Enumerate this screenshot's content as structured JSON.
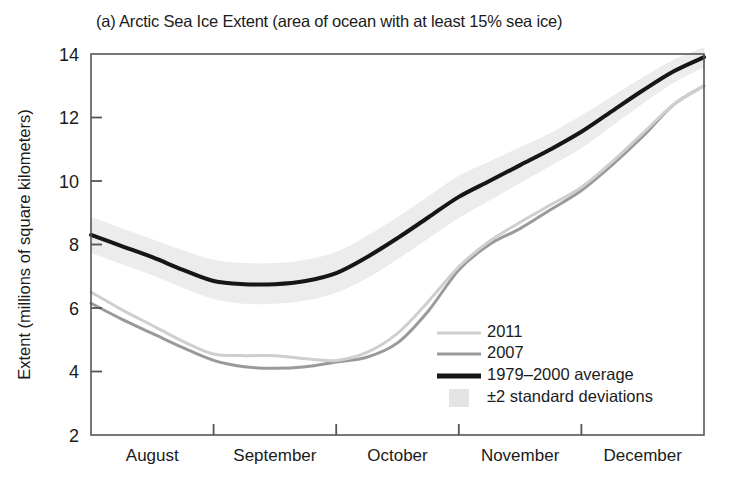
{
  "figure": {
    "panel_label": "(a)",
    "title": "(a) Arctic Sea Ice Extent (area of ocean with at least 15% sea ice)"
  },
  "colors": {
    "average_line": "#161616",
    "line_2007": "#9a9a9a",
    "line_2011": "#cfcfcf",
    "band_fill": "#ececec",
    "axis": "#555555",
    "text": "#1b1b1b",
    "background": "#ffffff"
  },
  "legend": {
    "position": "inside-lower-right",
    "items": [
      {
        "label": "2011",
        "swatch": "line",
        "color": "#cfcfcf"
      },
      {
        "label": "2007",
        "swatch": "line",
        "color": "#9a9a9a"
      },
      {
        "label": "1979–2000 average",
        "swatch": "line",
        "color": "#161616"
      },
      {
        "label": "±2 standard deviations",
        "swatch": "band",
        "color": "#e4e4e4"
      }
    ]
  },
  "chart_data": {
    "type": "line",
    "title": "(a) Arctic Sea Ice Extent (area of ocean with at least 15% sea ice)",
    "xlabel": "",
    "ylabel": "Extent (millions of square kilometers)",
    "ylim": [
      2,
      14
    ],
    "yticks": [
      2,
      4,
      6,
      8,
      10,
      12,
      14
    ],
    "ytick_labels": [
      "2",
      "4",
      "6",
      "8",
      "10",
      "12",
      "14"
    ],
    "xlim": [
      0,
      5
    ],
    "xticks": [
      1,
      2,
      3,
      4
    ],
    "xtick_labels": [
      "August",
      "September",
      "October",
      "November",
      "December"
    ],
    "xtick_label_positions": [
      0.5,
      1.5,
      2.5,
      3.5,
      4.5
    ],
    "x_unit": "month (1 unit = 1 month, 0 = Aug 1, 5 = Dec 31)",
    "grid": false,
    "legend_position": "lower right (inside axes)",
    "series": [
      {
        "name": "1979–2000 average",
        "color": "#161616",
        "width": 4,
        "x": [
          0.0,
          0.25,
          0.5,
          0.75,
          1.0,
          1.25,
          1.5,
          1.75,
          2.0,
          2.25,
          2.5,
          2.75,
          3.0,
          3.25,
          3.5,
          3.75,
          4.0,
          4.25,
          4.5,
          4.75,
          5.0
        ],
        "y": [
          8.3,
          7.95,
          7.6,
          7.2,
          6.85,
          6.75,
          6.75,
          6.85,
          7.1,
          7.6,
          8.2,
          8.85,
          9.5,
          10.0,
          10.5,
          11.0,
          11.55,
          12.2,
          12.85,
          13.45,
          13.9
        ]
      },
      {
        "name": "2007",
        "color": "#9a9a9a",
        "width": 3,
        "x": [
          0.0,
          0.25,
          0.5,
          0.75,
          1.0,
          1.25,
          1.5,
          1.75,
          2.0,
          2.25,
          2.5,
          2.75,
          3.0,
          3.25,
          3.5,
          3.75,
          4.0,
          4.25,
          4.5,
          4.75,
          5.0
        ],
        "y": [
          6.15,
          5.65,
          5.2,
          4.75,
          4.35,
          4.15,
          4.1,
          4.15,
          4.3,
          4.45,
          4.9,
          5.9,
          7.2,
          8.0,
          8.5,
          9.1,
          9.7,
          10.5,
          11.4,
          12.4,
          13.0
        ]
      },
      {
        "name": "2011",
        "color": "#cfcfcf",
        "width": 3,
        "x": [
          0.0,
          0.25,
          0.5,
          0.75,
          1.0,
          1.25,
          1.5,
          1.75,
          2.0,
          2.25,
          2.5,
          2.75,
          3.0,
          3.25,
          3.5,
          3.75,
          4.0,
          4.25,
          4.5,
          4.75,
          5.0
        ],
        "y": [
          6.5,
          5.95,
          5.45,
          4.95,
          4.55,
          4.5,
          4.5,
          4.4,
          4.35,
          4.6,
          5.2,
          6.2,
          7.3,
          8.1,
          8.7,
          9.25,
          9.8,
          10.6,
          11.5,
          12.4,
          13.0
        ]
      }
    ],
    "band": {
      "name": "±2 standard deviations",
      "fill": "#ececec",
      "x": [
        0.0,
        0.25,
        0.5,
        0.75,
        1.0,
        1.25,
        1.5,
        1.75,
        2.0,
        2.25,
        2.5,
        2.75,
        3.0,
        3.25,
        3.5,
        3.75,
        4.0,
        4.25,
        4.5,
        4.75,
        5.0
      ],
      "upper": [
        8.85,
        8.5,
        8.15,
        7.8,
        7.5,
        7.4,
        7.4,
        7.5,
        7.75,
        8.25,
        8.85,
        9.5,
        10.15,
        10.6,
        11.05,
        11.5,
        12.05,
        12.65,
        13.25,
        13.8,
        14.2
      ],
      "lower": [
        7.75,
        7.4,
        7.05,
        6.65,
        6.3,
        6.15,
        6.15,
        6.25,
        6.5,
        6.95,
        7.55,
        8.2,
        8.85,
        9.4,
        9.95,
        10.5,
        11.05,
        11.75,
        12.45,
        13.1,
        13.6
      ]
    }
  }
}
